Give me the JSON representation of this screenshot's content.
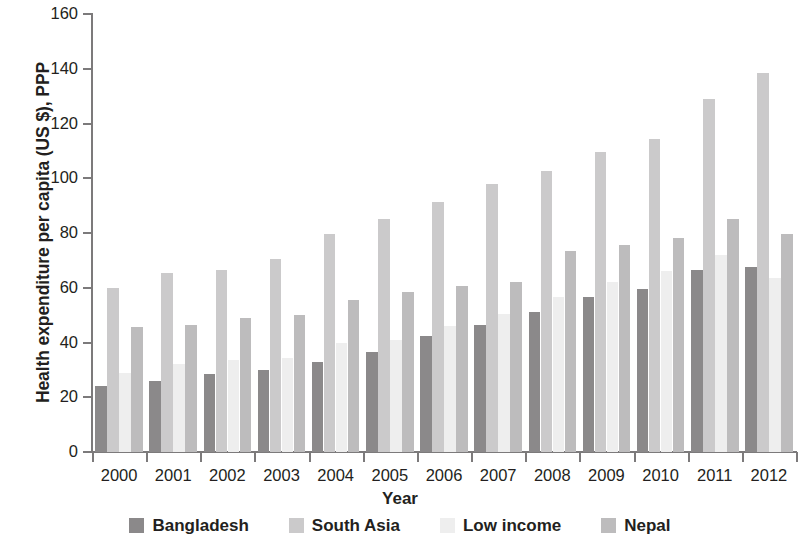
{
  "chart_data": {
    "type": "bar",
    "title": "",
    "xlabel": "Year",
    "ylabel": "Health expenditure per capita (US $), PPP",
    "ylim": [
      0,
      160
    ],
    "yticks": [
      0,
      20,
      40,
      60,
      80,
      100,
      120,
      140,
      160
    ],
    "grid": false,
    "legend_position": "bottom",
    "categories": [
      "2000",
      "2001",
      "2002",
      "2003",
      "2004",
      "2005",
      "2006",
      "2007",
      "2008",
      "2009",
      "2010",
      "2011",
      "2012"
    ],
    "series": [
      {
        "name": "Bangladesh",
        "color": "#8b898a",
        "values": [
          24,
          26,
          28.5,
          30,
          33,
          36.5,
          42.5,
          46.5,
          51,
          56.5,
          59.5,
          66.5,
          67.5
        ]
      },
      {
        "name": "South Asia",
        "color": "#cbcacb",
        "values": [
          60,
          65.5,
          66.5,
          70.5,
          79.5,
          85,
          91.5,
          98,
          102.5,
          109.5,
          114.5,
          129,
          138.5
        ]
      },
      {
        "name": "Low income",
        "color": "#eeeeee",
        "values": [
          29,
          32,
          33.5,
          34.5,
          40,
          41,
          46,
          50.5,
          56.5,
          62,
          66,
          72,
          63.5
        ]
      },
      {
        "name": "Nepal",
        "color": "#bdbcbd",
        "values": [
          45.5,
          46.5,
          49,
          50,
          55.5,
          58.5,
          60.5,
          62,
          73.5,
          75.5,
          78,
          85,
          79.5
        ]
      }
    ]
  },
  "axes": {
    "y_tick_labels": [
      "0",
      "20",
      "40",
      "60",
      "80",
      "100",
      "120",
      "140",
      "160"
    ],
    "y_title": "Health expenditure per capita (US $), PPP",
    "x_tick_labels": [
      "2000",
      "2001",
      "2002",
      "2003",
      "2004",
      "2005",
      "2006",
      "2007",
      "2008",
      "2009",
      "2010",
      "2011",
      "2012"
    ],
    "x_title": "Year"
  },
  "legend": {
    "items": [
      {
        "label": "Bangladesh",
        "color": "#8b898a"
      },
      {
        "label": "South Asia",
        "color": "#cbcacb"
      },
      {
        "label": "Low income",
        "color": "#eeeeee"
      },
      {
        "label": "Nepal",
        "color": "#bdbcbd"
      }
    ]
  }
}
